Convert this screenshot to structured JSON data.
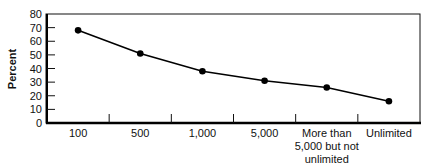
{
  "chart_data": {
    "type": "line",
    "title": "",
    "xlabel": "",
    "ylabel": "Percent",
    "ylim": [
      0,
      80
    ],
    "yticks": [
      "0",
      "10",
      "20",
      "30",
      "40",
      "50",
      "60",
      "70",
      "80"
    ],
    "categories": [
      "100",
      "500",
      "1,000",
      "5,000",
      "More than 5,000 but not unlimited",
      "Unlimited"
    ],
    "category_label_lines": [
      [
        "100"
      ],
      [
        "500"
      ],
      [
        "1,000"
      ],
      [
        "5,000"
      ],
      [
        "More than",
        "5,000 but not",
        "unlimited"
      ],
      [
        "Unlimited"
      ]
    ],
    "series": [
      {
        "name": "Percent",
        "values": [
          68,
          51,
          38,
          31,
          26,
          16
        ],
        "color": "#000000",
        "marker": "circle"
      }
    ],
    "grid": false,
    "legend": "none"
  }
}
